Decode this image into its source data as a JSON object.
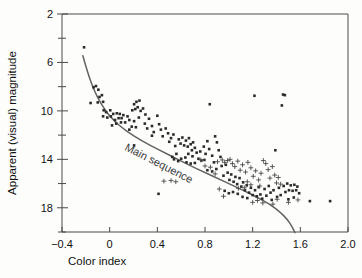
{
  "chart_data": {
    "type": "scatter",
    "title": "",
    "xlabel": "Color index",
    "ylabel": "Apparent (visual) magnitude",
    "xlim": [
      -0.4,
      2.0
    ],
    "ylim": [
      2,
      20
    ],
    "y_inverted": true,
    "grid": false,
    "legend": "none",
    "x_ticks": [
      -0.4,
      0,
      0.4,
      0.8,
      1.2,
      1.6,
      2.0
    ],
    "x_tick_labels": [
      "−0.4",
      "0",
      "0.4",
      "0.8",
      "1.2",
      "1.6",
      "2.0"
    ],
    "y_ticks": [
      2,
      4,
      6,
      8,
      10,
      12,
      14,
      16,
      18,
      20
    ],
    "y_tick_labels": [
      "2",
      "",
      "6",
      "",
      "10",
      "",
      "14",
      "",
      "18",
      ""
    ],
    "y_major_ticks": [
      2,
      6,
      10,
      14,
      18
    ],
    "annotations": [
      {
        "text": "Main sequence",
        "x": 0.12,
        "y": 13.2,
        "rotation": 27
      }
    ],
    "curves": [
      {
        "name": "Main sequence",
        "color": "#636363",
        "points": [
          [
            -0.225,
            5.45
          ],
          [
            -0.2,
            6.3
          ],
          [
            -0.175,
            7.1
          ],
          [
            -0.15,
            7.8
          ],
          [
            -0.12,
            8.5
          ],
          [
            -0.09,
            9.1
          ],
          [
            -0.05,
            9.75
          ],
          [
            -0.01,
            10.3
          ],
          [
            0.04,
            10.85
          ],
          [
            0.1,
            11.35
          ],
          [
            0.17,
            11.85
          ],
          [
            0.25,
            12.35
          ],
          [
            0.34,
            12.85
          ],
          [
            0.44,
            13.35
          ],
          [
            0.55,
            13.9
          ],
          [
            0.66,
            14.45
          ],
          [
            0.78,
            15.0
          ],
          [
            0.9,
            15.55
          ],
          [
            1.02,
            16.1
          ],
          [
            1.14,
            16.65
          ],
          [
            1.25,
            17.2
          ],
          [
            1.35,
            17.75
          ],
          [
            1.43,
            18.35
          ],
          [
            1.49,
            18.95
          ],
          [
            1.53,
            19.55
          ],
          [
            1.555,
            20.05
          ]
        ]
      }
    ],
    "series": [
      {
        "name": "stars-square",
        "marker": "square",
        "color": "#2b2b2b",
        "points": [
          [
            -0.215,
            4.75
          ],
          [
            -0.135,
            8.05
          ],
          [
            -0.115,
            7.95
          ],
          [
            -0.095,
            8.25
          ],
          [
            -0.085,
            8.85
          ],
          [
            -0.1,
            9.3
          ],
          [
            -0.065,
            8.7
          ],
          [
            -0.055,
            9.25
          ],
          [
            -0.16,
            9.35
          ],
          [
            -0.05,
            9.95
          ],
          [
            -0.03,
            10.1
          ],
          [
            -0.02,
            10.55
          ],
          [
            -0.055,
            10.45
          ],
          [
            0.005,
            9.95
          ],
          [
            0.01,
            10.45
          ],
          [
            0.03,
            10.25
          ],
          [
            0.045,
            10.75
          ],
          [
            0.06,
            10.2
          ],
          [
            0.075,
            10.6
          ],
          [
            0.085,
            10.25
          ],
          [
            0.1,
            10.6
          ],
          [
            0.115,
            10.35
          ],
          [
            0.095,
            10.95
          ],
          [
            0.055,
            11.05
          ],
          [
            0.02,
            11.2
          ],
          [
            0.13,
            10.95
          ],
          [
            0.15,
            10.45
          ],
          [
            0.165,
            10.75
          ],
          [
            0.19,
            9.95
          ],
          [
            0.205,
            9.45
          ],
          [
            0.225,
            9.25
          ],
          [
            0.215,
            9.85
          ],
          [
            0.235,
            9.7
          ],
          [
            0.25,
            9.15
          ],
          [
            0.26,
            10.0
          ],
          [
            0.245,
            10.55
          ],
          [
            0.205,
            10.85
          ],
          [
            0.22,
            11.35
          ],
          [
            0.185,
            11.3
          ],
          [
            0.165,
            11.55
          ],
          [
            0.28,
            9.8
          ],
          [
            0.3,
            10.3
          ],
          [
            0.295,
            11.05
          ],
          [
            0.315,
            11.45
          ],
          [
            0.33,
            10.65
          ],
          [
            0.355,
            11.25
          ],
          [
            0.37,
            11.75
          ],
          [
            0.355,
            12.05
          ],
          [
            0.4,
            10.4
          ],
          [
            0.415,
            11.1
          ],
          [
            0.43,
            11.55
          ],
          [
            0.445,
            12.1
          ],
          [
            0.205,
            12.85
          ],
          [
            0.41,
            16.85
          ],
          [
            0.47,
            11.45
          ],
          [
            0.49,
            11.85
          ],
          [
            0.5,
            12.55
          ],
          [
            0.515,
            12.25
          ],
          [
            0.535,
            11.95
          ],
          [
            0.55,
            12.9
          ],
          [
            0.56,
            13.55
          ],
          [
            0.525,
            13.8
          ],
          [
            0.58,
            12.35
          ],
          [
            0.595,
            12.7
          ],
          [
            0.61,
            12.2
          ],
          [
            0.625,
            12.85
          ],
          [
            0.64,
            12.45
          ],
          [
            0.655,
            12.95
          ],
          [
            0.665,
            12.25
          ],
          [
            0.68,
            12.75
          ],
          [
            0.69,
            13.25
          ],
          [
            0.7,
            12.6
          ],
          [
            0.715,
            13.05
          ],
          [
            0.66,
            13.55
          ],
          [
            0.635,
            13.85
          ],
          [
            0.6,
            13.95
          ],
          [
            0.575,
            14.15
          ],
          [
            0.695,
            13.75
          ],
          [
            0.73,
            13.45
          ],
          [
            0.745,
            13.95
          ],
          [
            0.76,
            13.35
          ],
          [
            0.77,
            14.1
          ],
          [
            0.715,
            14.3
          ],
          [
            0.68,
            14.35
          ],
          [
            0.645,
            14.25
          ],
          [
            0.54,
            14.0
          ],
          [
            0.79,
            12.95
          ],
          [
            0.805,
            13.55
          ],
          [
            0.82,
            12.5
          ],
          [
            0.835,
            13.15
          ],
          [
            0.84,
            9.45
          ],
          [
            0.795,
            14.05
          ],
          [
            0.86,
            13.7
          ],
          [
            0.875,
            14.25
          ],
          [
            0.885,
            12.1
          ],
          [
            0.9,
            12.6
          ],
          [
            0.915,
            13.25
          ],
          [
            0.93,
            13.8
          ],
          [
            0.94,
            14.55
          ],
          [
            0.895,
            14.8
          ],
          [
            0.86,
            15.0
          ],
          [
            0.82,
            14.9
          ],
          [
            0.955,
            15.35
          ],
          [
            0.975,
            14.45
          ],
          [
            0.99,
            15.1
          ],
          [
            1.005,
            15.7
          ],
          [
            1.02,
            15.25
          ],
          [
            1.04,
            15.85
          ],
          [
            1.055,
            15.45
          ],
          [
            1.07,
            16.05
          ],
          [
            1.09,
            15.55
          ],
          [
            1.105,
            16.25
          ],
          [
            1.12,
            15.9
          ],
          [
            1.135,
            16.55
          ],
          [
            1.15,
            16.15
          ],
          [
            1.17,
            16.75
          ],
          [
            1.185,
            16.35
          ],
          [
            1.2,
            16.95
          ],
          [
            1.215,
            8.75
          ],
          [
            1.22,
            16.55
          ],
          [
            1.235,
            17.05
          ],
          [
            1.25,
            16.3
          ],
          [
            1.265,
            16.9
          ],
          [
            1.28,
            17.25
          ],
          [
            1.3,
            16.45
          ],
          [
            1.315,
            17.0
          ],
          [
            1.335,
            16.2
          ],
          [
            1.35,
            16.75
          ],
          [
            1.36,
            17.35
          ],
          [
            1.375,
            16.55
          ],
          [
            1.39,
            13.25
          ],
          [
            1.405,
            17.1
          ],
          [
            1.42,
            16.35
          ],
          [
            1.435,
            16.95
          ],
          [
            1.455,
            8.65
          ],
          [
            1.47,
            8.7
          ],
          [
            1.445,
            9.55
          ],
          [
            1.46,
            16.2
          ],
          [
            1.475,
            16.7
          ],
          [
            1.49,
            16.0
          ],
          [
            1.505,
            16.55
          ],
          [
            1.52,
            16.15
          ],
          [
            1.535,
            16.6
          ],
          [
            1.55,
            16.1
          ],
          [
            1.565,
            16.55
          ],
          [
            1.575,
            16.25
          ],
          [
            1.59,
            16.8
          ],
          [
            1.545,
            17.15
          ],
          [
            1.5,
            17.3
          ],
          [
            1.68,
            17.45
          ],
          [
            1.85,
            17.45
          ],
          [
            0.965,
            16.6
          ],
          [
            1.0,
            16.8
          ],
          [
            1.035,
            16.7
          ],
          [
            1.075,
            16.85
          ],
          [
            1.115,
            17.1
          ],
          [
            1.155,
            17.2
          ]
        ]
      },
      {
        "name": "stars-plus",
        "marker": "plus",
        "color": "#4a4a4a",
        "points": [
          [
            0.455,
            15.8
          ],
          [
            0.515,
            15.75
          ],
          [
            0.555,
            15.85
          ],
          [
            0.765,
            14.05
          ],
          [
            0.8,
            14.55
          ],
          [
            0.845,
            14.65
          ],
          [
            0.885,
            15.2
          ],
          [
            0.905,
            14.2
          ],
          [
            0.945,
            14.05
          ],
          [
            0.965,
            14.25
          ],
          [
            0.99,
            14.1
          ],
          [
            1.01,
            14.0
          ],
          [
            1.03,
            14.35
          ],
          [
            1.05,
            14.6
          ],
          [
            1.075,
            14.15
          ],
          [
            1.095,
            14.9
          ],
          [
            1.115,
            14.45
          ],
          [
            1.14,
            15.05
          ],
          [
            1.16,
            14.25
          ],
          [
            1.185,
            14.7
          ],
          [
            1.205,
            15.4
          ],
          [
            1.225,
            14.95
          ],
          [
            1.25,
            15.7
          ],
          [
            1.27,
            15.15
          ],
          [
            1.29,
            14.1
          ],
          [
            1.31,
            14.35
          ],
          [
            1.33,
            14.85
          ],
          [
            1.345,
            15.55
          ],
          [
            1.365,
            14.6
          ],
          [
            1.385,
            15.3
          ],
          [
            1.4,
            15.95
          ],
          [
            1.415,
            15.5
          ],
          [
            1.435,
            16.05
          ],
          [
            1.2,
            17.55
          ],
          [
            1.24,
            17.4
          ],
          [
            1.285,
            17.6
          ],
          [
            1.37,
            17.7
          ],
          [
            1.405,
            17.3
          ],
          [
            1.5,
            17.55
          ],
          [
            1.58,
            17.35
          ],
          [
            1.185,
            16.1
          ],
          [
            1.155,
            15.85
          ],
          [
            1.26,
            16.2
          ],
          [
            0.92,
            16.45
          ],
          [
            0.955,
            17.05
          ],
          [
            1.08,
            16.4
          ],
          [
            1.13,
            16.35
          ]
        ]
      }
    ]
  },
  "axis": {
    "x_title": "Color index",
    "y_title": "Apparent (visual) magnitude"
  }
}
